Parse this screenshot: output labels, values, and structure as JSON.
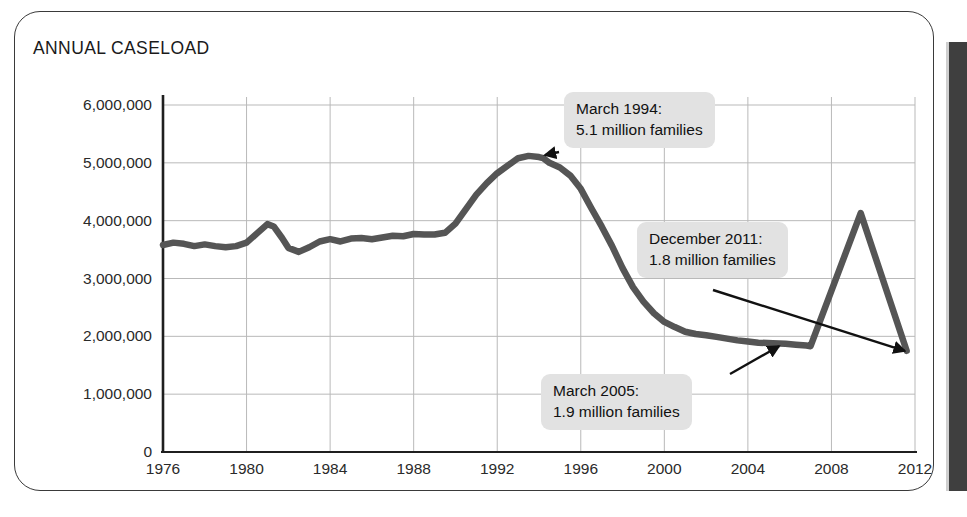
{
  "card": {
    "title": "ANNUAL CASELOAD",
    "border_color": "#3a3a3a",
    "right_bar_color": "#3f3f3f"
  },
  "chart_data": {
    "type": "line",
    "title": "ANNUAL CASELOAD",
    "xlabel": "",
    "ylabel": "",
    "xlim": [
      1976,
      2012
    ],
    "ylim": [
      0,
      6000000
    ],
    "grid": true,
    "legend": "none",
    "line_color": "#555555",
    "grid_color": "#b9b9b9",
    "axis_color": "#1f1f1f",
    "x_ticks": [
      "1976",
      "1980",
      "1984",
      "1988",
      "1992",
      "1996",
      "2000",
      "2004",
      "2008",
      "2012"
    ],
    "y_ticks": [
      "0",
      "1,000,000",
      "2,000,000",
      "3,000,000",
      "4,000,000",
      "5,000,000",
      "6,000,000"
    ],
    "y_tick_values": [
      0,
      1000000,
      2000000,
      3000000,
      4000000,
      5000000,
      6000000
    ],
    "series": [
      {
        "name": "Annual caseload (families)",
        "x": [
          1976.0,
          1976.5,
          1977.0,
          1977.5,
          1978.0,
          1978.5,
          1979.0,
          1979.5,
          1980.0,
          1980.5,
          1981.0,
          1981.3,
          1981.7,
          1982.0,
          1982.5,
          1983.0,
          1983.5,
          1984.0,
          1984.5,
          1985.0,
          1985.5,
          1986.0,
          1986.5,
          1987.0,
          1987.5,
          1988.0,
          1988.5,
          1989.0,
          1989.5,
          1990.0,
          1990.5,
          1991.0,
          1991.5,
          1992.0,
          1992.5,
          1993.0,
          1993.5,
          1994.0,
          1994.2,
          1994.5,
          1995.0,
          1995.5,
          1996.0,
          1996.5,
          1997.0,
          1997.5,
          1998.0,
          1998.5,
          1999.0,
          1999.5,
          2000.0,
          2000.5,
          2001.0,
          2001.5,
          2002.0,
          2002.5,
          2003.0,
          2003.5,
          2004.0,
          2004.5,
          2005.2,
          2005.8,
          2006.3,
          2006.8,
          2007.0,
          2009.4,
          2011.6
        ],
        "values": [
          3580000,
          3620000,
          3600000,
          3560000,
          3590000,
          3560000,
          3540000,
          3560000,
          3620000,
          3780000,
          3940000,
          3900000,
          3700000,
          3530000,
          3460000,
          3540000,
          3640000,
          3680000,
          3640000,
          3690000,
          3700000,
          3680000,
          3710000,
          3740000,
          3730000,
          3770000,
          3760000,
          3760000,
          3790000,
          3950000,
          4200000,
          4450000,
          4650000,
          4820000,
          4950000,
          5080000,
          5120000,
          5100000,
          5080000,
          5000000,
          4920000,
          4780000,
          4550000,
          4220000,
          3900000,
          3560000,
          3180000,
          2850000,
          2600000,
          2400000,
          2250000,
          2160000,
          2080000,
          2040000,
          2020000,
          1990000,
          1960000,
          1930000,
          1910000,
          1890000,
          1880000,
          1870000,
          1855000,
          1840000,
          1830000,
          4130000,
          1750000
        ]
      }
    ],
    "annotations": [
      {
        "id": "march-1994",
        "label_line1": "March 1994:",
        "label_line2": "5.1 million families",
        "point_x": 1994.0,
        "point_y": 5100000
      },
      {
        "id": "december-2011",
        "label_line1": "December 2011:",
        "label_line2": "1.8 million families",
        "point_x": 2011.6,
        "point_y": 1750000
      },
      {
        "id": "march-2005",
        "label_line1": "March 2005:",
        "label_line2": "1.9 million families",
        "point_x": 2005.2,
        "point_y": 1880000
      }
    ]
  }
}
